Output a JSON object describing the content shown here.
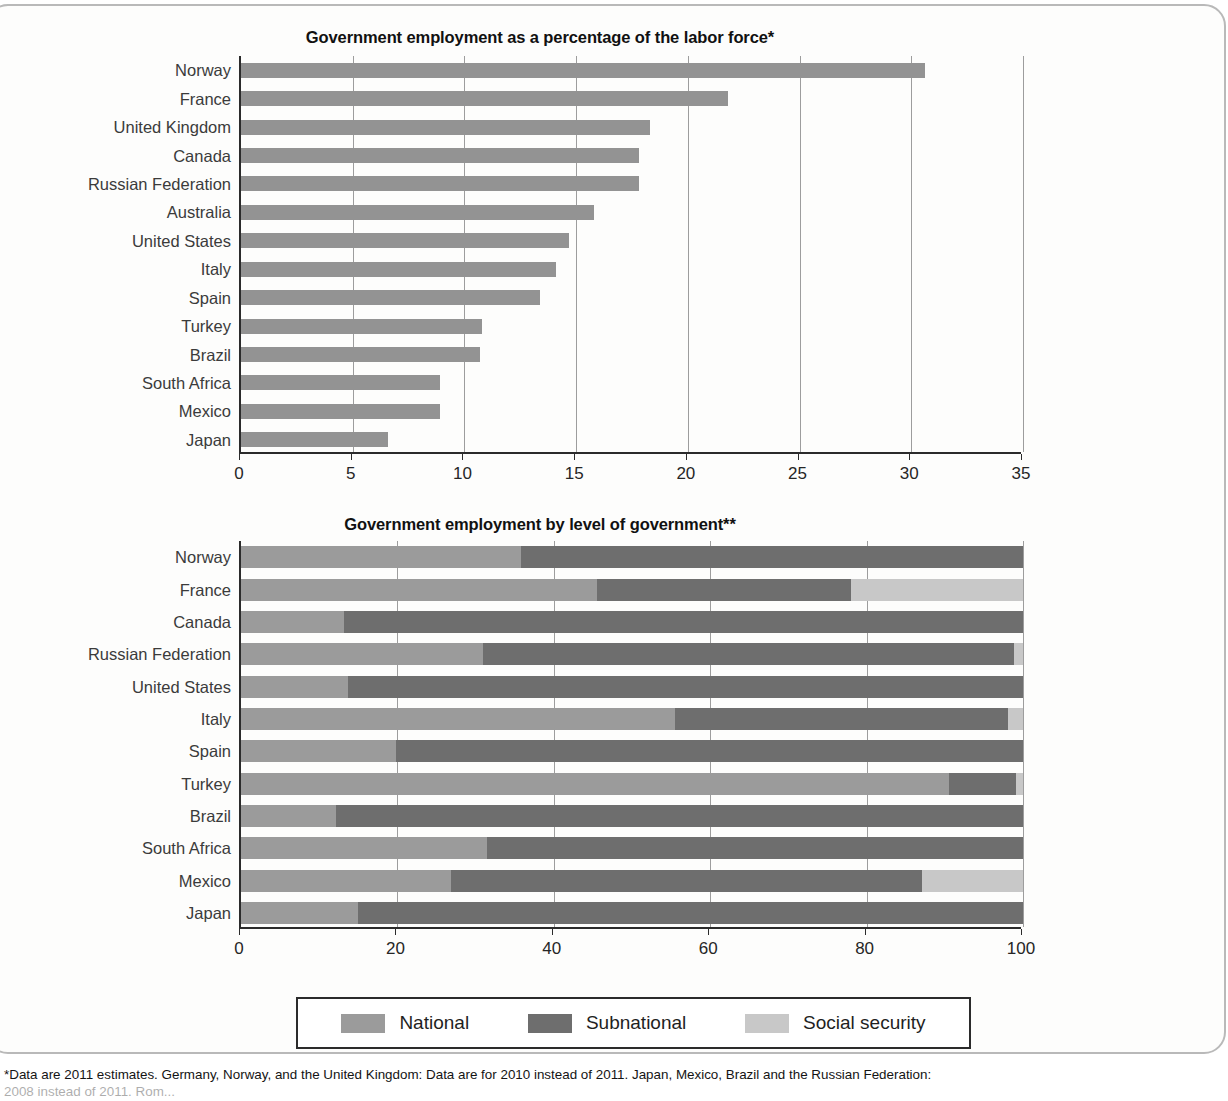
{
  "charts": [
    {
      "title": "Government employment as a percentage of the labor force*",
      "xlabel": "",
      "ylabel": "",
      "axis": {
        "min": 0,
        "max": 35,
        "step": 5
      },
      "ticks": [
        "0",
        "5",
        "10",
        "15",
        "20",
        "25",
        "30",
        "35"
      ],
      "categories": [
        "Norway",
        "France",
        "United Kingdom",
        "Canada",
        "Russian Federation",
        "Australia",
        "United States",
        "Italy",
        "Spain",
        "Turkey",
        "Brazil",
        "South Africa",
        "Mexico",
        "Japan"
      ],
      "values": [
        30.6,
        21.8,
        18.3,
        17.8,
        17.8,
        15.8,
        14.7,
        14.1,
        13.4,
        10.8,
        10.7,
        8.9,
        8.9,
        6.6
      ]
    },
    {
      "title": "Government employment by level of government**",
      "xlabel": "",
      "ylabel": "",
      "axis": {
        "min": 0,
        "max": 100,
        "step": 20
      },
      "ticks": [
        "0",
        "20",
        "40",
        "60",
        "80",
        "100"
      ],
      "categories": [
        "Norway",
        "France",
        "Canada",
        "Russian Federation",
        "United States",
        "Italy",
        "Spain",
        "Turkey",
        "Brazil",
        "South Africa",
        "Mexico",
        "Japan"
      ],
      "series": [
        {
          "name": "National",
          "color": "#9b9b9b",
          "values": [
            35.8,
            45.5,
            13.2,
            31.0,
            13.7,
            55.5,
            19.8,
            90.5,
            12.2,
            31.4,
            26.8,
            14.9
          ]
        },
        {
          "name": "Subnational",
          "color": "#6e6e6e",
          "values": [
            64.2,
            32.5,
            86.8,
            67.8,
            86.3,
            42.6,
            80.2,
            8.6,
            87.8,
            68.6,
            60.3,
            85.1
          ]
        },
        {
          "name": "Social security",
          "color": "#c8c8c8",
          "values": [
            0.0,
            22.0,
            0.0,
            1.2,
            0.0,
            1.9,
            0.0,
            0.9,
            0.0,
            0.0,
            12.9,
            0.0
          ]
        }
      ]
    }
  ],
  "chart_data": [
    {
      "type": "bar",
      "orientation": "horizontal",
      "title": "Government employment as a percentage of the labor force*",
      "xlabel": "",
      "ylabel": "",
      "xlim": [
        0,
        35
      ],
      "grid": true,
      "legend": "none",
      "categories": [
        "Norway",
        "France",
        "United Kingdom",
        "Canada",
        "Russian Federation",
        "Australia",
        "United States",
        "Italy",
        "Spain",
        "Turkey",
        "Brazil",
        "South Africa",
        "Mexico",
        "Japan"
      ],
      "values": [
        30.6,
        21.8,
        18.3,
        17.8,
        17.8,
        15.8,
        14.7,
        14.1,
        13.4,
        10.8,
        10.7,
        8.9,
        8.9,
        6.6
      ],
      "tick_labels": [
        "0",
        "5",
        "10",
        "15",
        "20",
        "25",
        "30",
        "35"
      ]
    },
    {
      "type": "bar",
      "orientation": "horizontal",
      "stacked": true,
      "title": "Government employment by level of government**",
      "xlabel": "",
      "ylabel": "",
      "xlim": [
        0,
        100
      ],
      "grid": true,
      "legend": "bottom",
      "categories": [
        "Norway",
        "France",
        "Canada",
        "Russian Federation",
        "United States",
        "Italy",
        "Spain",
        "Turkey",
        "Brazil",
        "South Africa",
        "Mexico",
        "Japan"
      ],
      "series": [
        {
          "name": "National",
          "values": [
            35.8,
            45.5,
            13.2,
            31.0,
            13.7,
            55.5,
            19.8,
            90.5,
            12.2,
            31.4,
            26.8,
            14.9
          ]
        },
        {
          "name": "Subnational",
          "values": [
            64.2,
            32.5,
            86.8,
            67.8,
            86.3,
            42.6,
            80.2,
            8.6,
            87.8,
            68.6,
            60.3,
            85.1
          ]
        },
        {
          "name": "Social security",
          "values": [
            0.0,
            22.0,
            0.0,
            1.2,
            0.0,
            1.9,
            0.0,
            0.9,
            0.0,
            0.0,
            12.9,
            0.0
          ]
        }
      ],
      "tick_labels": [
        "0",
        "20",
        "40",
        "60",
        "80",
        "100"
      ]
    }
  ],
  "legend": {
    "items": [
      {
        "label": "National",
        "color": "#9b9b9b"
      },
      {
        "label": "Subnational",
        "color": "#6e6e6e"
      },
      {
        "label": "Social security",
        "color": "#c8c8c8"
      }
    ]
  },
  "footnote": {
    "line1": "*Data are 2011 estimates. Germany, Norway, and the United Kingdom: Data are for 2010 instead of 2011. Japan, Mexico, Brazil and the Russian Federation:",
    "line2": "2008 instead of 2011. Rom..."
  }
}
